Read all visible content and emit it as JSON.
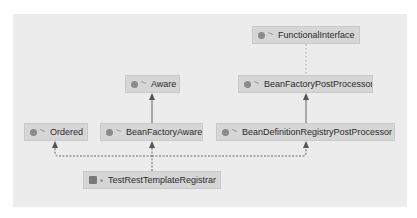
{
  "diagram": {
    "type": "uml-class-hierarchy",
    "nodes": [
      {
        "id": "functional_interface",
        "label": "FunctionalInterface",
        "kind": "annotation"
      },
      {
        "id": "aware",
        "label": "Aware",
        "kind": "interface"
      },
      {
        "id": "bean_factory_post_processor",
        "label": "BeanFactoryPostProcessor",
        "kind": "interface"
      },
      {
        "id": "ordered",
        "label": "Ordered",
        "kind": "interface"
      },
      {
        "id": "bean_factory_aware",
        "label": "BeanFactoryAware",
        "kind": "interface"
      },
      {
        "id": "bean_definition_registry_post_processor",
        "label": "BeanDefinitionRegistryPostProcessor",
        "kind": "interface"
      },
      {
        "id": "test_rest_template_registrar",
        "label": "TestRestTemplateRegistrar",
        "kind": "class"
      }
    ],
    "edges": [
      {
        "from": "bean_factory_post_processor",
        "to": "functional_interface",
        "style": "dotted",
        "meaning": "annotated-with"
      },
      {
        "from": "bean_factory_aware",
        "to": "aware",
        "style": "solid",
        "meaning": "extends"
      },
      {
        "from": "bean_definition_registry_post_processor",
        "to": "bean_factory_post_processor",
        "style": "solid",
        "meaning": "extends"
      },
      {
        "from": "test_rest_template_registrar",
        "to": "ordered",
        "style": "dashed",
        "meaning": "implements"
      },
      {
        "from": "test_rest_template_registrar",
        "to": "bean_factory_aware",
        "style": "dashed",
        "meaning": "implements"
      },
      {
        "from": "test_rest_template_registrar",
        "to": "bean_definition_registry_post_processor",
        "style": "dashed",
        "meaning": "implements"
      }
    ]
  },
  "icons": {
    "annotation": "annotation-icon",
    "interface": "interface-icon",
    "class": "class-icon"
  }
}
